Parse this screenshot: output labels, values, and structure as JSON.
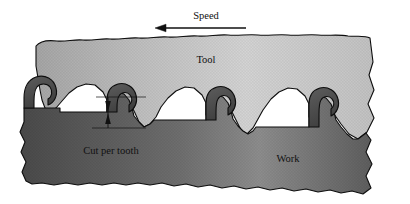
{
  "figure": {
    "title_labels": {
      "speed": "Speed",
      "tool": "Tool",
      "work": "Work",
      "cut_per_tooth": "Cut per tooth"
    },
    "colors": {
      "tool_fill_light": "#d2d2d2",
      "tool_fill_dark": "#9a9a9a",
      "work_fill_dark": "#4e4e4e",
      "work_fill_light": "#8e8e8e",
      "chip_fill_dark": "#4e4e4e",
      "outline": "#0d0d0d",
      "background": "#ffffff",
      "text": "#111111"
    },
    "annotations": {
      "speed_arrow_direction": "left",
      "speed_arrow_start_x": 246,
      "speed_arrow_end_x": 156,
      "speed_arrow_y": 28,
      "dimension_label": "Cut per tooth",
      "dimension_x": 108,
      "dimension_top_y": 98,
      "dimension_bottom_y": 128
    },
    "parts": [
      {
        "name": "tool",
        "label": "Tool",
        "shade": "light-gray",
        "position": "upper"
      },
      {
        "name": "work",
        "label": "Work",
        "shade": "dark-gray",
        "position": "lower"
      },
      {
        "name": "chips",
        "label": "",
        "shade": "dark-gray",
        "count": 4
      }
    ],
    "tooth_count": 4,
    "caption": ""
  }
}
